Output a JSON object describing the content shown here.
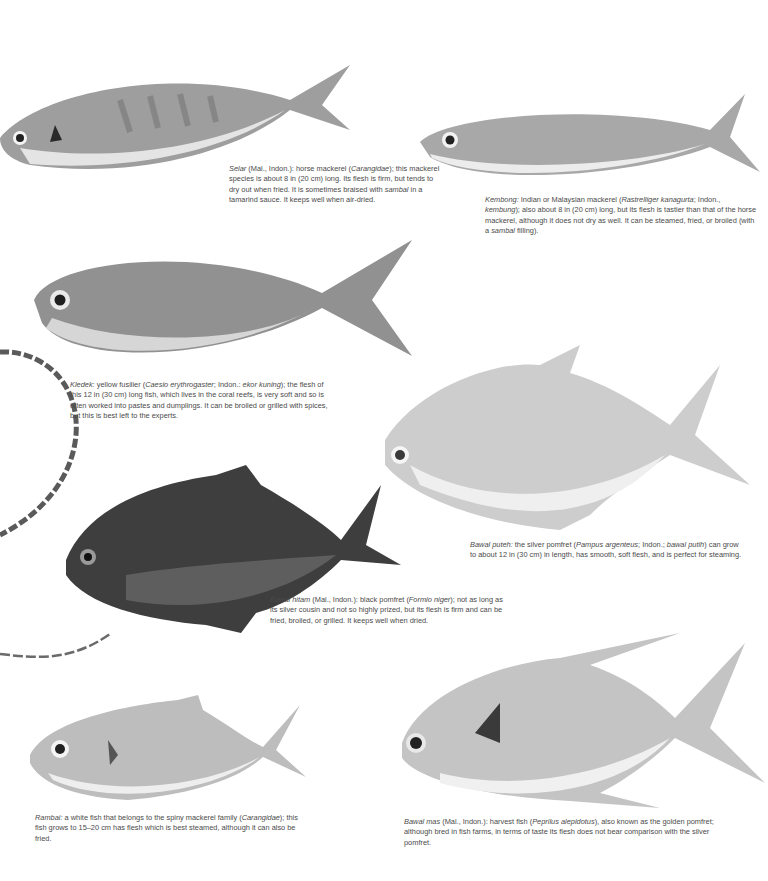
{
  "page": {
    "background": "#ffffff",
    "text_color": "#4a4a4a"
  },
  "entries": [
    {
      "id": "selar",
      "name": "Selar",
      "caption_parts": [
        {
          "t": "Selar",
          "i": true
        },
        {
          "t": " (Mal., Indon.): horse mackerel (",
          "i": false
        },
        {
          "t": "Carangidae",
          "i": true
        },
        {
          "t": "); this mackerel species is about 8 in (20 cm) long. Its flesh is firm, but tends to dry out when fried. It is sometimes braised with ",
          "i": false
        },
        {
          "t": "sambal",
          "i": true
        },
        {
          "t": " in a tamarind sauce. It keeps well when air-dried.",
          "i": false
        }
      ]
    },
    {
      "id": "kembong",
      "name": "Kembong",
      "caption_parts": [
        {
          "t": "Kembong:",
          "i": true
        },
        {
          "t": " Indian or Malaysian mackerel (",
          "i": false
        },
        {
          "t": "Rastrelliger kanagurta",
          "i": true
        },
        {
          "t": "; Indon., ",
          "i": false
        },
        {
          "t": "kembung",
          "i": true
        },
        {
          "t": "); also about 8 in (20 cm) long, but its flesh is tastier than that of the horse mackerel, although it does not dry as well. It can be steamed, fried, or broiled (with a ",
          "i": false
        },
        {
          "t": "sambal",
          "i": true
        },
        {
          "t": " filling).",
          "i": false
        }
      ]
    },
    {
      "id": "kledek",
      "name": "Kledek",
      "caption_parts": [
        {
          "t": "Kledek:",
          "i": true
        },
        {
          "t": " yellow fusilier (",
          "i": false
        },
        {
          "t": "Caesio erythrogaster",
          "i": true
        },
        {
          "t": "; Indon.: ",
          "i": false
        },
        {
          "t": "ekor kuning",
          "i": true
        },
        {
          "t": "); the flesh of this 12 in (30 cm) long fish, which lives in the coral reefs, is very soft and so is often worked into pastes and dumplings. It can be broiled or grilled with spices, but this is best left to the experts.",
          "i": false
        }
      ]
    },
    {
      "id": "bawal-puteh",
      "name": "Bawal puteh",
      "caption_parts": [
        {
          "t": "Bawal puteh:",
          "i": true
        },
        {
          "t": " the silver pomfret (",
          "i": false
        },
        {
          "t": "Pampus argenteus",
          "i": true
        },
        {
          "t": "; Indon.; ",
          "i": false
        },
        {
          "t": "bawal putih",
          "i": true
        },
        {
          "t": ") can grow to about 12 in (30 cm) in length, has smooth, soft flesh, and is perfect for steaming.",
          "i": false
        }
      ]
    },
    {
      "id": "bawal-hitam",
      "name": "Bawal hitam",
      "caption_parts": [
        {
          "t": "Bawal hitam",
          "i": true
        },
        {
          "t": " (Mal., Indon.): black pomfret (",
          "i": false
        },
        {
          "t": "Formio niger",
          "i": true
        },
        {
          "t": "); not as long as its silver cousin and not so highly prized, but its flesh is firm and can be fried, broiled, or grilled. It keeps well when dried.",
          "i": false
        }
      ]
    },
    {
      "id": "rambai",
      "name": "Rambai",
      "caption_parts": [
        {
          "t": "Rambai:",
          "i": true
        },
        {
          "t": " a white fish that belongs to the spiny mackerel family (",
          "i": false
        },
        {
          "t": "Carangidae",
          "i": true
        },
        {
          "t": "); this fish grows to 15–20 cm has flesh which is best steamed, although it can also be fried.",
          "i": false
        }
      ]
    },
    {
      "id": "bawal-mas",
      "name": "Bawal mas",
      "caption_parts": [
        {
          "t": "Bawal mas",
          "i": true
        },
        {
          "t": " (Mal., Indon.): harvest fish (",
          "i": false
        },
        {
          "t": "Peprilus alepidotus",
          "i": true
        },
        {
          "t": "), also known as the golden pomfret; although bred in fish farms, in terms of taste its flesh does not bear comparison with the silver pomfret.",
          "i": false
        }
      ]
    }
  ],
  "images": {
    "selar": {
      "label": "horse-mackerel-photo",
      "body_color": "#9a9a9a",
      "belly_color": "#e6e6e6"
    },
    "kembong": {
      "label": "indian-mackerel-photo",
      "body_color": "#a8a8a8",
      "belly_color": "#ececec"
    },
    "kledek": {
      "label": "yellow-fusilier-photo",
      "body_color": "#8e8e8e",
      "belly_color": "#d8d8d8"
    },
    "bawal_puteh": {
      "label": "silver-pomfret-photo",
      "body_color": "#cfcfcf",
      "belly_color": "#f0f0f0"
    },
    "bawal_hitam": {
      "label": "black-pomfret-photo",
      "body_color": "#3e3e3e",
      "belly_color": "#6a6a6a"
    },
    "rambai": {
      "label": "white-fish-photo",
      "body_color": "#bdbdbd",
      "belly_color": "#efefef"
    },
    "bawal_mas": {
      "label": "harvest-fish-photo",
      "body_color": "#c4c4c4",
      "belly_color": "#f2f2f2"
    }
  }
}
